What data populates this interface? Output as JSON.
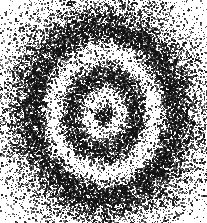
{
  "figure": {
    "width": 207,
    "height": 223,
    "background_color": "#ffffff",
    "dot_color": "#111111",
    "medium": "stipple / pointillist dot field",
    "symmetry": "elliptical, vertically elongated"
  },
  "chart_data": {
    "type": "scatter",
    "subtitle": "",
    "xlabel": "",
    "ylabel": "",
    "xlim": [
      0,
      207
    ],
    "ylim": [
      0,
      223
    ],
    "grid": false,
    "legend": "none",
    "axes_visible": false,
    "tick_labels_x": [],
    "tick_labels_y": [],
    "annotations": [],
    "marker": {
      "shape": "square-dot",
      "color": "#111111",
      "size_px_min": 1,
      "size_px_max": 2,
      "opacity_min": 0.45,
      "opacity_max": 1.0
    },
    "center": {
      "x": 103,
      "y": 113
    },
    "ellipse_aspect_ratio_y_over_x": 1.17,
    "total_points": 21000,
    "random_seed": 20240617,
    "density_profile": {
      "radius": [
        0.0,
        0.04,
        0.08,
        0.13,
        0.18,
        0.24,
        0.3,
        0.36,
        0.42,
        0.48,
        0.54,
        0.6,
        0.66,
        0.72,
        0.78,
        0.84,
        0.9,
        0.96,
        1.02,
        1.1,
        1.2,
        1.35,
        1.5,
        1.7
      ],
      "density": [
        1.0,
        0.92,
        0.55,
        0.18,
        0.08,
        0.22,
        0.62,
        0.88,
        0.8,
        0.48,
        0.16,
        0.07,
        0.2,
        0.58,
        0.86,
        0.92,
        0.78,
        0.6,
        0.46,
        0.32,
        0.2,
        0.11,
        0.05,
        0.0
      ]
    },
    "bands": [
      {
        "name": "central-nucleus",
        "kind": "dense",
        "r_inner": 0.0,
        "r_outer": 0.07,
        "peak_density": 1.0
      },
      {
        "name": "inner-bright-gap",
        "kind": "bright",
        "r_inner": 0.07,
        "r_outer": 0.22,
        "peak_density": 0.08
      },
      {
        "name": "first-dark-ring",
        "kind": "dense",
        "r_inner": 0.22,
        "r_outer": 0.48,
        "peak_density": 0.89
      },
      {
        "name": "second-bright-gap",
        "kind": "bright",
        "r_inner": 0.48,
        "r_outer": 0.64,
        "peak_density": 0.07
      },
      {
        "name": "second-dark-ring",
        "kind": "dense",
        "r_inner": 0.64,
        "r_outer": 0.94,
        "peak_density": 0.92
      },
      {
        "name": "outer-halo-falloff",
        "kind": "fade",
        "r_inner": 0.94,
        "r_outer": 1.7,
        "peak_density": 0.48
      }
    ],
    "series": [
      {
        "name": "stipple-points",
        "color": "#111111",
        "point_count": 21000,
        "distribution": "radial-density-weighted with angular jitter"
      }
    ]
  }
}
